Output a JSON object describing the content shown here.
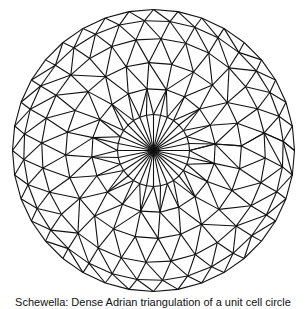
{
  "figure": {
    "type": "triangular-mesh-disk",
    "center": [
      153.5,
      150.5
    ],
    "stroke_color": "#111111",
    "background": "#ffffff",
    "stroke_width": 1.1,
    "rings": [
      {
        "radius": 36,
        "count": 32,
        "offset_deg": 0
      },
      {
        "radius": 62,
        "count": 20,
        "offset_deg": 6
      },
      {
        "radius": 88,
        "count": 24,
        "offset_deg": 3
      },
      {
        "radius": 112,
        "count": 28,
        "offset_deg": 9
      },
      {
        "radius": 130,
        "count": 32,
        "offset_deg": 4
      },
      {
        "radius": 141,
        "count": 36,
        "offset_deg": 0
      }
    ]
  },
  "caption": {
    "text": "Schewella: Dense Adrian triangulation of a unit cell circle"
  }
}
